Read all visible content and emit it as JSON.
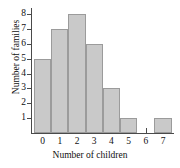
{
  "chart_data": {
    "type": "bar",
    "title": "",
    "xlabel": "Number of children",
    "ylabel": "Number of families",
    "categories": [
      "0",
      "1",
      "2",
      "3",
      "4",
      "5",
      "6",
      "7"
    ],
    "values": [
      5,
      7,
      8,
      6,
      3,
      1,
      0,
      1
    ],
    "series": [
      {
        "name": "Number of families",
        "values": [
          5,
          7,
          8,
          6,
          3,
          1,
          0,
          1
        ]
      }
    ],
    "xtick_labels": [
      "0",
      "1",
      "2",
      "3",
      "4",
      "5",
      "6",
      "7"
    ],
    "ytick_labels": [
      "1",
      "2",
      "3",
      "4",
      "5",
      "6",
      "7",
      "8"
    ],
    "ytick_values": [
      1,
      2,
      3,
      4,
      5,
      6,
      7,
      8
    ],
    "ylim": [
      0,
      8.5
    ],
    "grid": false,
    "legend": false,
    "bar_fill_color": "#c9c9c9",
    "bar_edge_color": "#9b9b9b",
    "axis_color": "#4a4a4a",
    "background_color": "#ffffff"
  }
}
